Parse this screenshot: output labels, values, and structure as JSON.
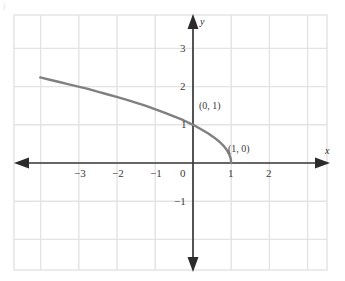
{
  "chart_data": {
    "type": "line",
    "title": "",
    "subtitle": "",
    "xlabel": "x",
    "ylabel": "y",
    "xlim": [
      -4.0,
      3.5
    ],
    "ylim": [
      -2.9,
      3.9
    ],
    "grid": true,
    "grid_step": 1,
    "legend": "none",
    "x_ticks": [
      -3,
      -2,
      -1,
      0,
      1,
      2
    ],
    "x_tick_labels": [
      "−3",
      "−2",
      "−1",
      "0",
      "1",
      "2"
    ],
    "y_ticks": [
      3,
      2,
      1,
      -1
    ],
    "y_tick_labels": [
      "3",
      "2",
      "1",
      "−1"
    ],
    "series": [
      {
        "name": "curve",
        "color": "#808080",
        "x": [
          -4.0,
          -3.75,
          -3.5,
          -3.25,
          -3.0,
          -2.75,
          -2.5,
          -2.25,
          -2.0,
          -1.75,
          -1.5,
          -1.25,
          -1.0,
          -0.75,
          -0.5,
          -0.25,
          0.0,
          0.2,
          0.4,
          0.55,
          0.7,
          0.8,
          0.88,
          0.94,
          0.97,
          0.99,
          1.0
        ],
        "y": [
          2.24,
          2.18,
          2.12,
          2.06,
          2.0,
          1.94,
          1.87,
          1.8,
          1.73,
          1.66,
          1.58,
          1.5,
          1.41,
          1.32,
          1.22,
          1.12,
          1.0,
          0.89,
          0.77,
          0.67,
          0.55,
          0.45,
          0.35,
          0.24,
          0.17,
          0.1,
          0.0
        ]
      }
    ],
    "annotations": [
      {
        "text": "(0, 1)",
        "x": 0.0,
        "y": 1.0
      },
      {
        "text": "(1, 0)",
        "x": 1.0,
        "y": 0.0
      }
    ]
  },
  "axes": {
    "x_axis_name": "x",
    "y_axis_name": "y"
  },
  "colors": {
    "curve": "#808080",
    "axis": "#3a3a3a",
    "grid": "#e3e3e3",
    "text": "#3a3a3a",
    "background": "#ffffff"
  },
  "artifact": {
    "mark": ")"
  }
}
